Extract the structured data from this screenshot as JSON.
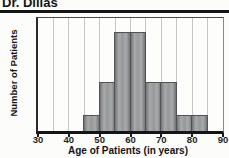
{
  "title": "Dr. Dillas",
  "colors": {
    "bar_fill": "#97989a",
    "bar_edge_dark": "#737476",
    "bar_border": "#515254",
    "gridline": "#c6c6c4",
    "axis": "#151515",
    "text": "#141414",
    "background": "#fcfcfa"
  },
  "chart_data": {
    "type": "bar",
    "title": "Dr. Dillas",
    "xlabel": "Age of Patients (in years)",
    "ylabel": "Number of Patients",
    "xlim": [
      30,
      90
    ],
    "ylim": [
      0,
      7
    ],
    "x_ticks": [
      30,
      40,
      50,
      60,
      70,
      80,
      90
    ],
    "grid": "vertical, every 5 years",
    "y_axis_tick_labels_visible": false,
    "bin_width": 5,
    "bin_starts": [
      30,
      35,
      40,
      45,
      50,
      55,
      60,
      65,
      70,
      75,
      80,
      85
    ],
    "values": [
      0,
      0,
      0,
      1,
      3,
      6,
      6,
      3,
      3,
      1,
      1,
      0
    ]
  }
}
